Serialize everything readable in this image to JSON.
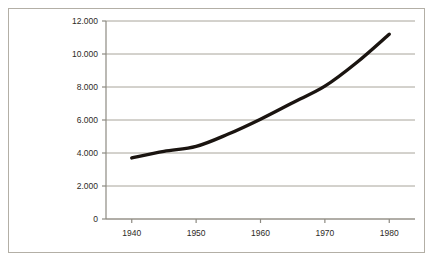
{
  "chart_data": {
    "type": "line",
    "title": "",
    "subtitle": "",
    "xlabel": "",
    "ylabel": "",
    "legend": [],
    "legend_position": "none",
    "grid": true,
    "grid_axis": "y",
    "xlim": [
      1936,
      1984
    ],
    "ylim": [
      0,
      12000
    ],
    "x_ticks": [
      1940,
      1950,
      1960,
      1970,
      1980
    ],
    "x_tick_labels": [
      "1940",
      "1950",
      "1960",
      "1970",
      "1980"
    ],
    "y_ticks": [
      0,
      2000,
      4000,
      6000,
      8000,
      10000,
      12000
    ],
    "y_tick_labels": [
      "0",
      "2.000",
      "4.000",
      "6.000",
      "8.000",
      "10.000",
      "12.000"
    ],
    "series": [
      {
        "name": "series-1",
        "color": "#1a1410",
        "line_width": 3.4,
        "x": [
          1940,
          1945,
          1950,
          1955,
          1960,
          1965,
          1970,
          1975,
          1980
        ],
        "values": [
          3700,
          4100,
          4400,
          5150,
          6050,
          7050,
          8050,
          9500,
          11200
        ]
      }
    ],
    "annotations": []
  },
  "style": {
    "background_color": "#ffffff",
    "frame_border_color": "#b3afa6",
    "grid_color": "#a8a49a",
    "axis_color": "#8d8a82",
    "tick_label_color": "#2e2a26",
    "line_color": "#1a1410"
  }
}
